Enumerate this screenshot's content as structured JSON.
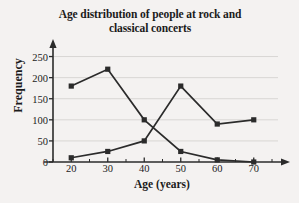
{
  "chart_data": {
    "type": "line",
    "title": "Age distribution of people at rock and classical concerts",
    "title_line1": "Age distribution of people at rock and",
    "title_line2": "classical concerts",
    "xlabel": "Age (years)",
    "ylabel": "Frequency",
    "x": [
      20,
      30,
      40,
      50,
      60,
      70
    ],
    "xticklabels": [
      "20",
      "30",
      "40",
      "50",
      "60",
      "70"
    ],
    "yticks": [
      0,
      50,
      100,
      150,
      200,
      250
    ],
    "yticklabels": [
      "0",
      "50",
      "100",
      "150",
      "200",
      "250"
    ],
    "xlim": [
      15,
      75
    ],
    "ylim": [
      0,
      275
    ],
    "grid": "horizontal",
    "legend": "none",
    "marker": "square",
    "series": [
      {
        "name": "rock",
        "values": [
          180,
          220,
          100,
          25,
          5,
          0
        ],
        "color": "#2b2b2b"
      },
      {
        "name": "classical",
        "values": [
          10,
          25,
          50,
          180,
          90,
          100
        ],
        "color": "#2b2b2b"
      }
    ]
  },
  "style": {
    "background": "#f4f2f1",
    "axis_color": "#2b2b2b",
    "grid_color": "#d8d6d4",
    "text_color": "#1b1b1b"
  }
}
